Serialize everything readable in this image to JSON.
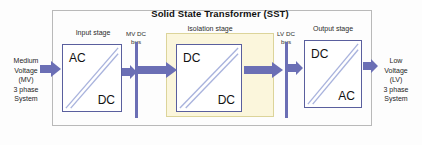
{
  "diagram": {
    "title": "Solid State Transformer (SST)",
    "stages": [
      {
        "id": "input",
        "label": "Input stage",
        "top_text": "AC",
        "bottom_text": "DC"
      },
      {
        "id": "isolation",
        "label": "Isolation stage",
        "top_text": "DC",
        "bottom_text": "DC"
      },
      {
        "id": "output",
        "label": "Output stage",
        "top_text": "DC",
        "bottom_text": "AC"
      }
    ],
    "buses": [
      {
        "id": "mv-dc-bus",
        "line1": "MV DC",
        "line2": "bus"
      },
      {
        "id": "lv-dc-bus",
        "line1": "LV DC",
        "line2": "bus"
      }
    ],
    "left_terminal": {
      "line1": "Medium",
      "line2": "Voltage",
      "line3": "(MV)",
      "line4": "3 phase",
      "line5": "System"
    },
    "right_terminal": {
      "line1": "Low",
      "line2": "Voltage",
      "line3": "(LV)",
      "line4": "3 phase",
      "line5": "System"
    },
    "colors": {
      "arrow": "#6b6fb5",
      "block_border": "#5a5f9e",
      "isolation_fill": "#fbf6dc",
      "isolation_border": "#dcd49a",
      "frame_border": "#b9b9b9",
      "diagonal": "#a9b3dd"
    }
  }
}
